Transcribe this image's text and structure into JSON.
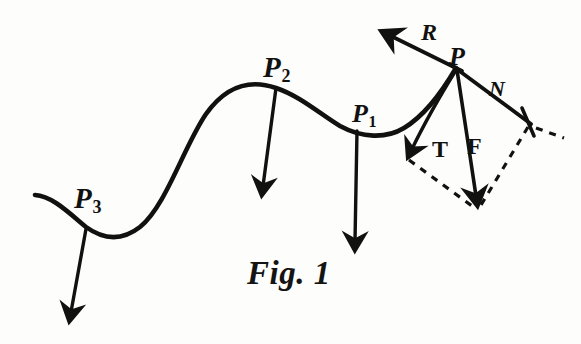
{
  "figure": {
    "caption": "Fig. 1",
    "ink_color": "#111110",
    "background_color": "#fdfdfc"
  },
  "labels": {
    "p3": {
      "base": "P",
      "sub": "3"
    },
    "p2": {
      "base": "P",
      "sub": "2"
    },
    "p1": {
      "base": "P",
      "sub": "1"
    },
    "p": {
      "base": "P",
      "sub": ""
    },
    "r": {
      "base": "R",
      "sub": ""
    },
    "n": {
      "base": "N",
      "sub": ""
    },
    "t": {
      "base": "T",
      "sub": ""
    },
    "f": {
      "base": "F",
      "sub": ""
    }
  },
  "geometry": {
    "curve_path": "M 35 195 C 52 196 68 212 86 227 C 104 240 122 241 140 227 C 166 206 184 146 206 114 C 226 86 250 79 276 88 C 300 96 320 114 340 126 C 362 138 386 139 404 128 C 424 116 442 92 456 68",
    "arrows": [
      {
        "name": "weight-arrow-p3",
        "from": [
          86,
          229
        ],
        "to": [
          70,
          322
        ]
      },
      {
        "name": "weight-arrow-p2",
        "from": [
          276,
          88
        ],
        "to": [
          262,
          196
        ]
      },
      {
        "name": "weight-arrow-p1",
        "from": [
          357,
          131
        ],
        "to": [
          355,
          251
        ]
      },
      {
        "name": "resultant-arrow-r",
        "from": [
          456,
          68
        ],
        "to": [
          386,
          33
        ]
      },
      {
        "name": "tangential-arrow-t",
        "from": [
          456,
          68
        ],
        "to": [
          409,
          156
        ]
      },
      {
        "name": "force-arrow-f",
        "from": [
          456,
          68
        ],
        "to": [
          477,
          206
        ]
      }
    ],
    "normal_line": {
      "name": "normal-line-n",
      "from": [
        456,
        68
      ],
      "to": [
        529,
        122
      ]
    },
    "normal_tick": {
      "name": "normal-tick-mark",
      "center": [
        529,
        122
      ],
      "half_len": 12
    },
    "dashed_lines": [
      {
        "name": "dashed-edge-left",
        "from": [
          409,
          158
        ],
        "to": [
          477,
          206
        ]
      },
      {
        "name": "dashed-edge-right",
        "from": [
          529,
          124
        ],
        "to": [
          479,
          206
        ]
      },
      {
        "name": "dashed-tail",
        "from": [
          534,
          126
        ],
        "to": [
          562,
          136
        ]
      }
    ]
  }
}
